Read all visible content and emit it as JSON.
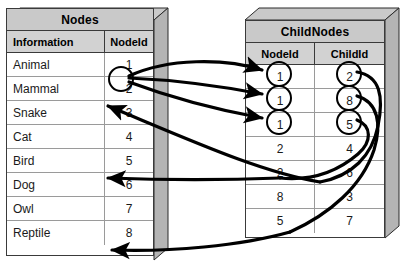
{
  "diagram": {
    "background": "#ffffff",
    "box_top_color": "#c9c9c9",
    "box_side_color": "#b4b4b4",
    "header_color": "#d2d2d2",
    "line_color": "#000000"
  },
  "nodes_table": {
    "title": "Nodes",
    "columns": [
      "Information",
      "NodeId"
    ],
    "rows": [
      {
        "information": "Animal",
        "nodeid": "1",
        "circled": true
      },
      {
        "information": "Mammal",
        "nodeid": "2",
        "circled": false
      },
      {
        "information": "Snake",
        "nodeid": "3",
        "circled": false
      },
      {
        "information": "Cat",
        "nodeid": "4",
        "circled": false
      },
      {
        "information": "Bird",
        "nodeid": "5",
        "circled": false
      },
      {
        "information": "Dog",
        "nodeid": "6",
        "circled": false
      },
      {
        "information": "Owl",
        "nodeid": "7",
        "circled": false
      },
      {
        "information": "Reptile",
        "nodeid": "8",
        "circled": false
      }
    ]
  },
  "childnodes_table": {
    "title": "ChildNodes",
    "columns": [
      "NodeId",
      "ChildId"
    ],
    "rows": [
      {
        "nodeid": "1",
        "childid": "2",
        "nodeid_circled": true,
        "childid_circled": true
      },
      {
        "nodeid": "1",
        "childid": "8",
        "nodeid_circled": true,
        "childid_circled": true
      },
      {
        "nodeid": "1",
        "childid": "5",
        "nodeid_circled": true,
        "childid_circled": true
      },
      {
        "nodeid": "2",
        "childid": "4",
        "nodeid_circled": false,
        "childid_circled": false
      },
      {
        "nodeid": "2",
        "childid": "6",
        "nodeid_circled": false,
        "childid_circled": false
      },
      {
        "nodeid": "8",
        "childid": "3",
        "nodeid_circled": false,
        "childid_circled": false
      },
      {
        "nodeid": "5",
        "childid": "7",
        "nodeid_circled": false,
        "childid_circled": false
      }
    ]
  },
  "arrows": {
    "from_nodeid_1_to_childnodes": 3,
    "from_childid_back_to_nodes": [
      "2",
      "8",
      "5"
    ]
  }
}
